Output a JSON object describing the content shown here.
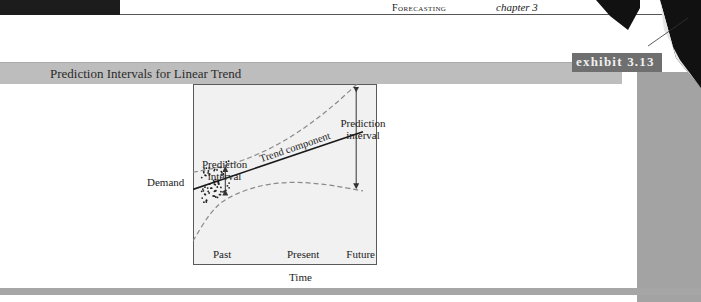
{
  "header": {
    "section": "Forecasting",
    "chapter": "chapter 3"
  },
  "exhibit": {
    "title": "Prediction Intervals for Linear Trend",
    "tag": "exhibit 3.13"
  },
  "colors": {
    "banner": "#bdbdbd",
    "exhibit_tag": "#6f6f6f",
    "right_margin": "#a3a3a3",
    "plot_background": "#f1f1f1",
    "trend_line": "#1a1a1a",
    "interval_band": "#8a8a8a"
  },
  "chart_data": {
    "type": "line",
    "title": "Prediction Intervals for Linear Trend",
    "xlabel": "Time",
    "ylabel": "Demand",
    "x_tick_labels": [
      "Past",
      "Present",
      "Future"
    ],
    "grid": false,
    "series": [
      {
        "name": "Trend component",
        "style": "solid",
        "points": [
          [
            0.0,
            0.35
          ],
          [
            1.0,
            0.72
          ]
        ]
      },
      {
        "name": "Upper prediction bound",
        "style": "dashed",
        "points": [
          [
            0.0,
            0.46
          ],
          [
            0.2,
            0.5
          ],
          [
            0.4,
            0.58
          ],
          [
            0.6,
            0.7
          ],
          [
            0.8,
            0.86
          ],
          [
            1.0,
            1.06
          ]
        ]
      },
      {
        "name": "Lower prediction bound",
        "style": "dashed",
        "points": [
          [
            0.0,
            0.02
          ],
          [
            0.1,
            0.2
          ],
          [
            0.2,
            0.3
          ],
          [
            0.4,
            0.38
          ],
          [
            0.6,
            0.4
          ],
          [
            0.8,
            0.38
          ],
          [
            1.0,
            0.34
          ]
        ]
      }
    ],
    "observed_data": {
      "description": "scatter of past observations clustered around the trend line",
      "x_range": [
        0.05,
        0.22
      ]
    },
    "annotations": [
      {
        "text": "Trend component",
        "target": "trend line"
      },
      {
        "text": "Prediction\ninterval",
        "target": "narrow interval at past data",
        "lines": [
          "Prediction",
          "interval"
        ]
      },
      {
        "text": "Prediction\ninterval",
        "target": "wide interval in future",
        "lines": [
          "Prediction",
          "interval"
        ]
      }
    ]
  },
  "labels": {
    "ylabel": "Demand",
    "xlabel": "Time",
    "ticks": [
      "Past",
      "Present",
      "Future"
    ],
    "trend": "Trend component",
    "interval_left": [
      "Prediction",
      "interval"
    ],
    "interval_right": [
      "Prediction",
      "interval"
    ]
  }
}
